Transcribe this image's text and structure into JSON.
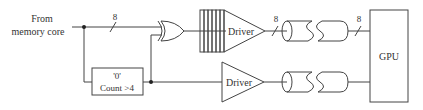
{
  "diagram": {
    "input_label_line1": "From",
    "input_label_line2": "memory core",
    "bus_width_in": "8",
    "bus_width_driver_out": "8",
    "bus_width_gpu_in": "8",
    "counter_box": {
      "line1": "'0'",
      "line2": "Count >4"
    },
    "driver_top_label": "Driver",
    "driver_bottom_label": "Driver",
    "gpu_label": "GPU",
    "stroke_color": "#444444"
  }
}
